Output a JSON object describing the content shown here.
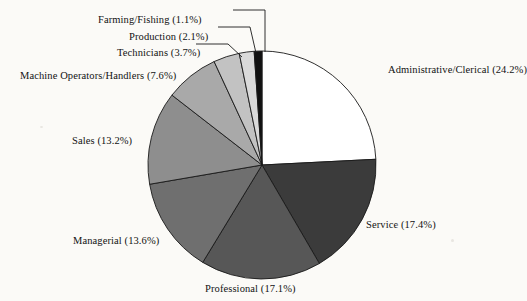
{
  "chart_data": {
    "type": "pie",
    "title": "",
    "subtitle": "",
    "xlabel": "",
    "ylabel": "",
    "legend_position": "none",
    "grid": false,
    "units": "percent",
    "total": 100.0,
    "categories": [
      "Administrative/Clerical",
      "Service",
      "Professional",
      "Managerial",
      "Sales",
      "Machine Operators/Handlers",
      "Technicians",
      "Production",
      "Farming/Fishing"
    ],
    "values": [
      24.2,
      17.4,
      17.1,
      13.6,
      13.2,
      7.6,
      3.7,
      2.1,
      1.1
    ],
    "slices": [
      {
        "name": "Administrative/Clerical",
        "value": 24.2,
        "label": "Administrative/Clerical (24.2%)",
        "color": "#ffffff",
        "start_pct": 0.0,
        "end_pct": 24.2,
        "label_x": 388,
        "label_y": 64,
        "label_anchor": "start",
        "leader": false
      },
      {
        "name": "Service",
        "value": 17.4,
        "label": "Service (17.4%)",
        "color": "#3b3b3b",
        "start_pct": 24.2,
        "end_pct": 41.6,
        "label_x": 366,
        "label_y": 219,
        "label_anchor": "start",
        "leader": false
      },
      {
        "name": "Professional",
        "value": 17.1,
        "label": "Professional (17.1%)",
        "color": "#575757",
        "start_pct": 41.6,
        "end_pct": 58.7,
        "label_x": 205,
        "label_y": 283,
        "label_anchor": "start",
        "leader": false
      },
      {
        "name": "Managerial",
        "value": 13.6,
        "label": "Managerial (13.6%)",
        "color": "#6f6f6f",
        "start_pct": 58.7,
        "end_pct": 72.3,
        "label_x": 73,
        "label_y": 235,
        "label_anchor": "start",
        "leader": false
      },
      {
        "name": "Sales",
        "value": 13.2,
        "label": "Sales (13.2%)",
        "color": "#8e8e8e",
        "start_pct": 72.3,
        "end_pct": 85.5,
        "label_x": 72,
        "label_y": 135,
        "label_anchor": "start",
        "leader": false
      },
      {
        "name": "Machine Operators/Handlers",
        "value": 7.6,
        "label": "Machine Operators/Handlers (7.6%)",
        "color": "#a9a9a9",
        "start_pct": 85.5,
        "end_pct": 93.1,
        "label_x": 20,
        "label_y": 70,
        "label_anchor": "start",
        "leader": false
      },
      {
        "name": "Technicians",
        "value": 3.7,
        "label": "Technicians (3.7%)",
        "color": "#c2c2c2",
        "start_pct": 93.1,
        "end_pct": 96.8,
        "label_x": 117,
        "label_y": 47,
        "label_anchor": "start",
        "leader": true
      },
      {
        "name": "Production",
        "value": 2.1,
        "label": "Production (2.1%)",
        "color": "#dadada",
        "start_pct": 96.8,
        "end_pct": 98.9,
        "label_x": 129,
        "label_y": 31,
        "label_anchor": "start",
        "leader": true
      },
      {
        "name": "Farming/Fishing",
        "value": 1.1,
        "label": "Farming/Fishing (1.1%)",
        "color": "#111111",
        "start_pct": 98.9,
        "end_pct": 100.0,
        "label_x": 98,
        "label_y": 14,
        "label_anchor": "start",
        "leader": true
      }
    ],
    "geometry": {
      "center_x": 262,
      "center_y": 165,
      "radius": 114,
      "start_angle_deg": -90,
      "direction": "clockwise"
    },
    "leaders": [
      {
        "name": "farming-fishing-leader",
        "points": "233,10 265,10 265,52"
      },
      {
        "name": "production-leader",
        "points": "218,27 250,27 256,53"
      },
      {
        "name": "technicians-leader",
        "points": "196,44 228,44 242,57"
      }
    ]
  }
}
